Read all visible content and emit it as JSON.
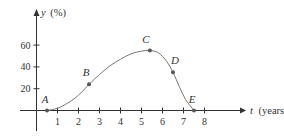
{
  "chart_data": {
    "type": "line",
    "title": "",
    "xlabel": "t (years)",
    "ylabel": "y (%)",
    "x_axis_var": "t",
    "x_axis_unit": "(years)",
    "y_axis_var": "y",
    "y_axis_unit": "(%)",
    "xticks": [
      1,
      2,
      3,
      4,
      5,
      6,
      7,
      8
    ],
    "yticks": [
      20,
      40,
      60
    ],
    "xlim": [
      0,
      8.5
    ],
    "ylim": [
      0,
      70
    ],
    "grid": false,
    "legend": null,
    "points": [
      {
        "label": "A",
        "t": 0.5,
        "y": 0
      },
      {
        "label": "B",
        "t": 2.5,
        "y": 24
      },
      {
        "label": "C",
        "t": 5.4,
        "y": 55
      },
      {
        "label": "D",
        "t": 6.5,
        "y": 35
      },
      {
        "label": "E",
        "t": 7.5,
        "y": 0
      }
    ],
    "curve": [
      [
        0.5,
        0
      ],
      [
        1.0,
        2
      ],
      [
        1.5,
        7
      ],
      [
        2.0,
        14
      ],
      [
        2.5,
        24
      ],
      [
        3.0,
        33
      ],
      [
        3.5,
        41
      ],
      [
        4.0,
        47
      ],
      [
        4.5,
        52
      ],
      [
        5.0,
        54.5
      ],
      [
        5.4,
        55
      ],
      [
        5.8,
        53
      ],
      [
        6.2,
        45
      ],
      [
        6.5,
        35
      ],
      [
        6.8,
        22
      ],
      [
        7.1,
        10
      ],
      [
        7.5,
        0
      ]
    ],
    "colors": {
      "curve": "#777777",
      "axis": "#333333",
      "point": "#555555"
    }
  }
}
